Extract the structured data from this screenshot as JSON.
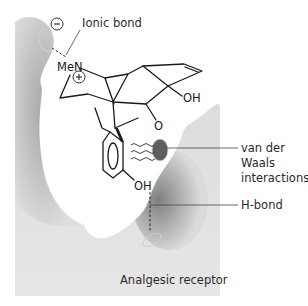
{
  "diagram": {
    "receptor_label": "Analgesic receptor",
    "colors": {
      "receptor_light": "#e2e2e2",
      "receptor_dark": "#7a7a7a",
      "pocket": "#ffffff",
      "bond_line": "#1a1a1a",
      "label_text": "#2a2a2a"
    },
    "annotations": [
      {
        "id": "ionic",
        "lines": [
          "Ionic bond"
        ]
      },
      {
        "id": "vdw",
        "lines": [
          "van der",
          "Waals",
          "interactions"
        ]
      },
      {
        "id": "hbond",
        "lines": [
          "H-bond"
        ]
      }
    ],
    "molecule": {
      "atoms": {
        "amine": "MeN",
        "hydroxyl_top": "OH",
        "ether_oxygen": "O",
        "hydroxyl_phenol": "OH"
      },
      "charges": {
        "receptor_site": "−",
        "amine": "+"
      }
    }
  }
}
